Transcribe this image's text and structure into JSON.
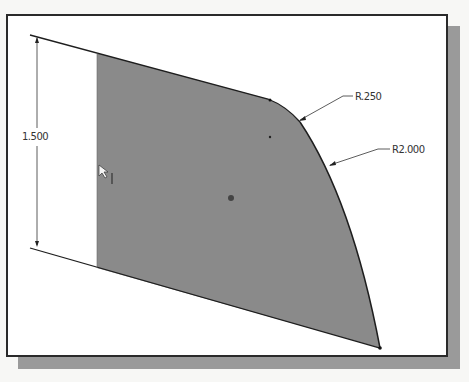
{
  "sketch": {
    "dimensions": {
      "height": "1.500",
      "fillet_radius": "R.250",
      "arc_radius": "R2.000"
    },
    "colors": {
      "fill": "#8a8a8a",
      "line": "#1e1e1e",
      "background": "#ffffff",
      "shadow": "#9a9a9a"
    },
    "cursor": "select-arrow"
  }
}
